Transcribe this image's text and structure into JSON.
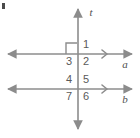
{
  "figure": {
    "stroke_color": "#8c8c8c",
    "label_color": "#5a5a5a",
    "background_color": "#ffffff",
    "corner_artifact": {
      "name": "corner-mark",
      "color": "#4a4a4a"
    },
    "lines": [
      {
        "id": "t",
        "label": "t",
        "role": "transversal",
        "orientation": "vertical",
        "x": 78,
        "y1": 6,
        "y2": 132,
        "arrows": "both",
        "parallel_marks": 0,
        "label_x": 86,
        "label_y": 8
      },
      {
        "id": "a",
        "label": "a",
        "role": "parallel-line",
        "orientation": "horizontal",
        "y": 54,
        "x1": 6,
        "x2": 134,
        "arrows": "both",
        "parallel_marks": 1,
        "label_x": 120,
        "label_y": 60
      },
      {
        "id": "b",
        "label": "b",
        "role": "parallel-line",
        "orientation": "horizontal",
        "y": 89,
        "x1": 6,
        "x2": 134,
        "arrows": "both",
        "parallel_marks": 1,
        "label_x": 120,
        "label_y": 95
      }
    ],
    "right_angle_marker": {
      "name": "right-angle-square",
      "at_intersection": "t-and-a",
      "quadrant": "upper-left",
      "x": 64,
      "y": 41,
      "size": 11
    },
    "intersections": [
      {
        "name": "intersection-t-a",
        "x": 78,
        "y": 54,
        "angles": [
          {
            "id": "angle-1",
            "label": "1",
            "quadrant": "upper-right",
            "x": 82,
            "y": 41
          },
          {
            "id": "angle-2",
            "label": "2",
            "quadrant": "lower-right",
            "x": 82,
            "y": 57
          },
          {
            "id": "angle-3",
            "label": "3",
            "quadrant": "lower-left",
            "x": 64,
            "y": 57
          }
        ]
      },
      {
        "name": "intersection-t-b",
        "x": 78,
        "y": 89,
        "angles": [
          {
            "id": "angle-4",
            "label": "4",
            "quadrant": "upper-left",
            "x": 64,
            "y": 76
          },
          {
            "id": "angle-5",
            "label": "5",
            "quadrant": "upper-right",
            "x": 82,
            "y": 76
          },
          {
            "id": "angle-6",
            "label": "6",
            "quadrant": "lower-right",
            "x": 82,
            "y": 92
          },
          {
            "id": "angle-7",
            "label": "7",
            "quadrant": "lower-left",
            "x": 64,
            "y": 92
          }
        ]
      }
    ]
  }
}
